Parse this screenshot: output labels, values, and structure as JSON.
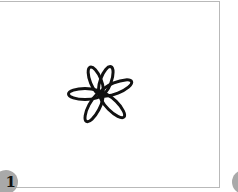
{
  "panels": [
    {
      "label": "1",
      "figure": {
        "icon": "six-petal-flower-icon",
        "stroke_color": "#111111",
        "center": [
          104,
          91
        ],
        "petals": [
          {
            "angle": -112,
            "length": 29
          },
          {
            "angle": -70,
            "length": 29
          },
          {
            "angle": -22,
            "length": 34
          },
          {
            "angle": 180,
            "length": 33
          },
          {
            "angle": 118,
            "length": 31
          },
          {
            "angle": 45,
            "length": 32
          }
        ]
      }
    },
    {
      "label": ""
    }
  ],
  "colors": {
    "border": "#b9b9b9",
    "badge": "#a9a9a9",
    "background": "#ffffff"
  }
}
